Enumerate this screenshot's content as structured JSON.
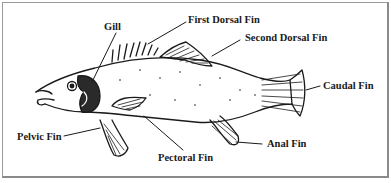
{
  "diagram": {
    "labels": [
      {
        "id": "gill",
        "text": "Gill"
      },
      {
        "id": "first_dorsal_fin",
        "text": "First Dorsal Fin"
      },
      {
        "id": "second_dorsal_fin",
        "text": "Second Dorsal Fin"
      },
      {
        "id": "caudal_fin",
        "text": "Caudal Fin"
      },
      {
        "id": "anal_fin",
        "text": "Anal Fin"
      },
      {
        "id": "pectoral_fin",
        "text": "Pectoral Fin"
      },
      {
        "id": "pelvic_fin",
        "text": "Pelvic Fin"
      }
    ],
    "colors": {
      "ink": "#1a1a1a",
      "border": "#9a9a9a",
      "background": "#ffffff"
    }
  }
}
